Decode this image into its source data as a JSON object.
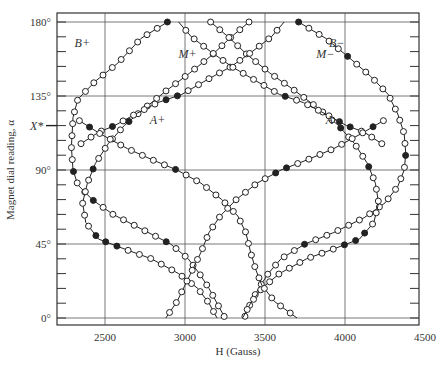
{
  "chart_data": {
    "type": "scatter",
    "title": "",
    "xlabel": "H (Gauss)",
    "ylabel": "Magnet dial reading, α",
    "xlim": [
      2200,
      4500
    ],
    "ylim": [
      -4,
      186
    ],
    "grid": true,
    "x_ticks": [
      2500,
      3000,
      3500,
      4000,
      4500
    ],
    "x_tick_labels": [
      "2500",
      "3000",
      "3500",
      "4000",
      "4500"
    ],
    "y_ticks": [
      0,
      45,
      90,
      135,
      180
    ],
    "y_tick_labels": [
      "0°",
      "45°",
      "90°",
      "135°",
      "180°"
    ],
    "y_marker": {
      "label": "X*",
      "value": 117
    },
    "series": [
      {
        "name": "B+",
        "label_pos": [
          2310,
          165
        ],
        "points": [
          [
            2890,
            180
          ],
          [
            2725,
            170
          ],
          [
            2580,
            155
          ],
          [
            2440,
            144
          ],
          [
            2330,
            133
          ],
          [
            2300,
            122
          ],
          [
            2290,
            104
          ],
          [
            2300,
            90
          ],
          [
            2330,
            81
          ],
          [
            2420,
            72
          ],
          [
            2550,
            63
          ],
          [
            2730,
            54
          ],
          [
            2910,
            45
          ],
          [
            3020,
            36
          ],
          [
            3090,
            27
          ],
          [
            3150,
            18
          ],
          [
            3200,
            9
          ],
          [
            3250,
            0
          ]
        ],
        "filled_at": [
          180,
          160,
          90,
          70,
          45
        ]
      },
      {
        "name": "B−",
        "label_pos": [
          3900,
          165
        ],
        "points": [
          [
            3710,
            180
          ],
          [
            3880,
            170
          ],
          [
            4030,
            158
          ],
          [
            4160,
            147
          ],
          [
            4270,
            136
          ],
          [
            4330,
            124
          ],
          [
            4370,
            112
          ],
          [
            4380,
            100
          ],
          [
            4370,
            90
          ],
          [
            4330,
            80
          ],
          [
            4250,
            70
          ],
          [
            4120,
            61
          ],
          [
            3930,
            52
          ],
          [
            3750,
            45
          ],
          [
            3600,
            36
          ],
          [
            3520,
            27
          ],
          [
            3460,
            18
          ],
          [
            3410,
            9
          ],
          [
            3370,
            0
          ]
        ],
        "filled_at": [
          180,
          160,
          100,
          45
        ]
      },
      {
        "name": "M+",
        "label_pos": [
          2960,
          158
        ],
        "points": [
          [
            3400,
            180
          ],
          [
            3290,
            171
          ],
          [
            3170,
            160
          ],
          [
            3030,
            149
          ],
          [
            2880,
            138
          ],
          [
            2740,
            127
          ],
          [
            2620,
            117
          ],
          [
            2520,
            106
          ],
          [
            2440,
            94
          ],
          [
            2390,
            82
          ],
          [
            2360,
            70
          ],
          [
            2380,
            58
          ],
          [
            2460,
            48
          ],
          [
            2620,
            42
          ],
          [
            2790,
            36
          ],
          [
            2960,
            27
          ],
          [
            3080,
            18
          ],
          [
            3150,
            9
          ],
          [
            3200,
            0
          ]
        ],
        "filled_at": [
          117,
          90,
          50,
          45
        ]
      },
      {
        "name": "M−",
        "label_pos": [
          3820,
          158
        ],
        "points": [
          [
            3160,
            180
          ],
          [
            3270,
            171
          ],
          [
            3390,
            160
          ],
          [
            3530,
            149
          ],
          [
            3690,
            138
          ],
          [
            3840,
            127
          ],
          [
            3960,
            117
          ],
          [
            4060,
            106
          ],
          [
            4140,
            94
          ],
          [
            4190,
            82
          ],
          [
            4210,
            70
          ],
          [
            4180,
            58
          ],
          [
            4090,
            48
          ],
          [
            3930,
            42
          ],
          [
            3760,
            36
          ],
          [
            3590,
            27
          ],
          [
            3480,
            18
          ],
          [
            3410,
            9
          ],
          [
            3360,
            0
          ]
        ],
        "filled_at": [
          117,
          90,
          50,
          45
        ]
      },
      {
        "name": "A+",
        "label_pos": [
          2780,
          118
        ],
        "points": [
          [
            2350,
            106
          ],
          [
            2460,
            113
          ],
          [
            2560,
            117
          ],
          [
            2690,
            124
          ],
          [
            2830,
            131
          ],
          [
            2980,
            136
          ],
          [
            3140,
            145
          ],
          [
            3290,
            153
          ],
          [
            3420,
            162
          ],
          [
            3540,
            171
          ],
          [
            3620,
            180
          ]
        ],
        "filled_at": [
          180,
          135,
          117
        ]
      },
      {
        "name": "A−",
        "label_pos": [
          3880,
          118
        ],
        "points": [
          [
            4230,
            106
          ],
          [
            4120,
            113
          ],
          [
            4010,
            117
          ],
          [
            3880,
            124
          ],
          [
            3740,
            131
          ],
          [
            3590,
            136
          ],
          [
            3430,
            145
          ],
          [
            3290,
            153
          ],
          [
            3160,
            162
          ],
          [
            3040,
            171
          ],
          [
            2960,
            180
          ]
        ],
        "filled_at": [
          180,
          135,
          117
        ]
      },
      {
        "name": "A+ lower",
        "label_pos": null,
        "points": [
          [
            2340,
            120
          ],
          [
            2470,
            112
          ],
          [
            2640,
            103
          ],
          [
            2800,
            96
          ],
          [
            2950,
            90
          ],
          [
            3100,
            82
          ],
          [
            3230,
            72
          ],
          [
            3330,
            62
          ],
          [
            3380,
            52
          ],
          [
            3410,
            40
          ],
          [
            3440,
            30
          ],
          [
            3480,
            20
          ],
          [
            3560,
            10
          ],
          [
            3700,
            0
          ]
        ],
        "filled_at": [
          117,
          90,
          0
        ]
      },
      {
        "name": "A− lower",
        "label_pos": null,
        "points": [
          [
            4240,
            120
          ],
          [
            4100,
            112
          ],
          [
            3930,
            103
          ],
          [
            3760,
            96
          ],
          [
            3600,
            90
          ],
          [
            3450,
            82
          ],
          [
            3320,
            72
          ],
          [
            3220,
            62
          ],
          [
            3150,
            52
          ],
          [
            3100,
            40
          ],
          [
            3050,
            30
          ],
          [
            3000,
            20
          ],
          [
            2950,
            10
          ],
          [
            2880,
            0
          ]
        ],
        "filled_at": [
          117,
          90,
          0
        ]
      }
    ]
  },
  "labels": {
    "x_axis_title": "H (Gauss)",
    "y_axis_title": "Magnet dial reading, α",
    "x_marker": "X*"
  }
}
